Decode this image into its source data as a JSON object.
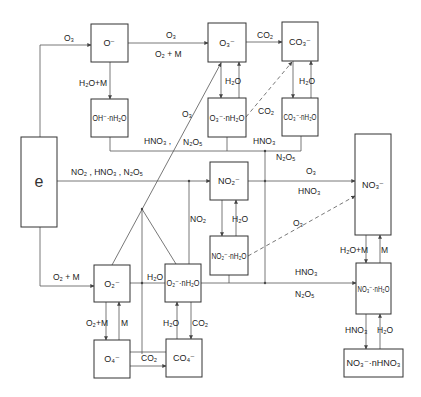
{
  "diagram": {
    "nodes": [
      {
        "id": "e",
        "label": "e",
        "x": 21,
        "y": 137,
        "w": 36,
        "h": 90
      },
      {
        "id": "O-",
        "label": "O⁻",
        "x": 91,
        "y": 24,
        "w": 37,
        "h": 38
      },
      {
        "id": "OH-nH2O",
        "label": "OH⁻·nH₂O",
        "x": 91,
        "y": 99,
        "w": 37,
        "h": 38
      },
      {
        "id": "O3-",
        "label": "O₃⁻",
        "x": 208,
        "y": 23,
        "w": 38,
        "h": 39
      },
      {
        "id": "CO3-",
        "label": "CO₃⁻",
        "x": 282,
        "y": 22,
        "w": 36,
        "h": 39
      },
      {
        "id": "O3-nH2O",
        "label": "O₃⁻·nH₂O",
        "x": 208,
        "y": 98,
        "w": 38,
        "h": 39
      },
      {
        "id": "CO3-nH2O",
        "label": "CO₃⁻·nH₂O",
        "x": 282,
        "y": 98,
        "w": 36,
        "h": 38
      },
      {
        "id": "NO2-",
        "label": "NO₂⁻",
        "x": 210,
        "y": 162,
        "w": 38,
        "h": 38
      },
      {
        "id": "NO2-nH2O",
        "label": "NO₂⁻·nH₂O",
        "x": 210,
        "y": 236,
        "w": 38,
        "h": 39
      },
      {
        "id": "NO3-",
        "label": "NO₃⁻",
        "x": 355,
        "y": 134,
        "w": 36,
        "h": 101
      },
      {
        "id": "NO3-nH2O",
        "label": "NO₃⁻·nH₂O",
        "x": 356,
        "y": 263,
        "w": 35,
        "h": 51
      },
      {
        "id": "NO3-nHNO3",
        "label": "NO₃⁻·nHNO₃",
        "x": 344,
        "y": 349,
        "w": 59,
        "h": 28
      },
      {
        "id": "O2-",
        "label": "O₂⁻",
        "x": 94,
        "y": 265,
        "w": 36,
        "h": 37
      },
      {
        "id": "O2-nH2O",
        "label": "O₂⁻·nH₂O",
        "x": 165,
        "y": 264,
        "w": 36,
        "h": 38
      },
      {
        "id": "O4-",
        "label": "O₄⁻",
        "x": 94,
        "y": 340,
        "w": 36,
        "h": 38
      },
      {
        "id": "CO4-",
        "label": "CO₄⁻",
        "x": 166,
        "y": 339,
        "w": 36,
        "h": 38
      }
    ],
    "edge_labels": [
      {
        "id": "e-O-",
        "text": "O₃",
        "x": 64,
        "y": 41
      },
      {
        "id": "O--O3-top",
        "text": "O₃",
        "x": 166,
        "y": 38
      },
      {
        "id": "O--O3-bottom",
        "text": "O₂ + M",
        "x": 155,
        "y": 57
      },
      {
        "id": "O3--CO3-",
        "text": "CO₂",
        "x": 257,
        "y": 38
      },
      {
        "id": "O--OH",
        "text": "H₂O+M",
        "x": 79,
        "y": 86
      },
      {
        "id": "O3-hyd",
        "text": "H₂O",
        "x": 225,
        "y": 84
      },
      {
        "id": "CO3-hyd",
        "text": "H₂O",
        "x": 299,
        "y": 84
      },
      {
        "id": "O3nH2O-CO3",
        "text": "CO₂",
        "x": 258,
        "y": 114
      },
      {
        "id": "diag-O3",
        "text": "O₃",
        "x": 182,
        "y": 117
      },
      {
        "id": "hno3-n2o5-left",
        "text": "HNO₃ ,",
        "x": 144,
        "y": 144
      },
      {
        "id": "n2o5-left",
        "text": "N₂O₅",
        "x": 183,
        "y": 145
      },
      {
        "id": "hno3-right",
        "text": "HNO₃",
        "x": 253,
        "y": 144
      },
      {
        "id": "n2o5-right",
        "text": "N₂O₅",
        "x": 276,
        "y": 160
      },
      {
        "id": "e-NO2-",
        "text": "NO₂ , HNO₃ , N₂O₅",
        "x": 71,
        "y": 175
      },
      {
        "id": "NO2-NO3-top",
        "text": "O₃",
        "x": 306,
        "y": 174
      },
      {
        "id": "NO2-NO3-bottom",
        "text": "HNO₃",
        "x": 298,
        "y": 194
      },
      {
        "id": "NO2-hyd",
        "text": "H₂O",
        "x": 232,
        "y": 222
      },
      {
        "id": "NO2-vertical",
        "text": "NO₂",
        "x": 190,
        "y": 222
      },
      {
        "id": "dash-O3",
        "text": "O₃",
        "x": 293,
        "y": 226
      },
      {
        "id": "NO3-hyd-left",
        "text": "H₂O+M",
        "x": 340,
        "y": 253
      },
      {
        "id": "NO3-hyd-right",
        "text": "M",
        "x": 381,
        "y": 253
      },
      {
        "id": "to-NO3nH2O-top",
        "text": "HNO₃",
        "x": 295,
        "y": 275
      },
      {
        "id": "to-NO3nH2O-bottom",
        "text": "N₂O₅",
        "x": 295,
        "y": 297
      },
      {
        "id": "e-O2-",
        "text": "O₂ + M",
        "x": 53,
        "y": 280
      },
      {
        "id": "O2-hyd",
        "text": "H₂O",
        "x": 147,
        "y": 280
      },
      {
        "id": "O2-O4-left",
        "text": "O₂+M",
        "x": 86,
        "y": 326
      },
      {
        "id": "O2-O4-right",
        "text": "M",
        "x": 121,
        "y": 326
      },
      {
        "id": "O2nH2O-CO4-left",
        "text": "H₂O",
        "x": 163,
        "y": 326
      },
      {
        "id": "O2nH2O-CO4-right",
        "text": "CO₂",
        "x": 192,
        "y": 326
      },
      {
        "id": "O4-CO4",
        "text": "CO₂",
        "x": 141,
        "y": 361
      },
      {
        "id": "NO3nH2O-nHNO3-left",
        "text": "HNO₃",
        "x": 345,
        "y": 333
      },
      {
        "id": "NO3nH2O-nHNO3-right",
        "text": "H₂O",
        "x": 377,
        "y": 333
      }
    ]
  }
}
